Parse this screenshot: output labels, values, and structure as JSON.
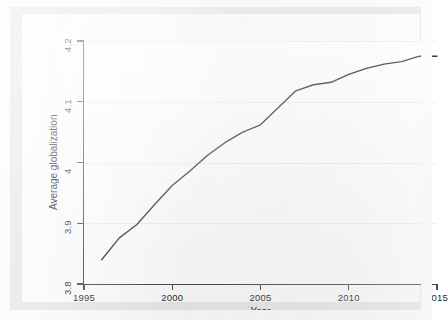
{
  "chart_data": {
    "type": "line",
    "title": "",
    "xlabel": "Year",
    "ylabel": "Average globalization",
    "xlim": [
      1995,
      2015
    ],
    "ylim": [
      3.8,
      4.2
    ],
    "xticks": [
      "1995",
      "2000",
      "2005",
      "2010",
      "2015"
    ],
    "xtick_values": [
      1995,
      2000,
      2005,
      2010,
      2015
    ],
    "yticks": [
      "3.8",
      "3.9",
      "4",
      "4.1",
      "4.2"
    ],
    "ytick_values": [
      3.8,
      3.9,
      4.0,
      4.1,
      4.2
    ],
    "grid": "horizontal",
    "legend": "none",
    "line_color": "#3c3c3c",
    "background_color": "#e9e9e7",
    "plot_background_color": "#ffffff",
    "axis_color": "#4a4a4a",
    "gridline_color": "#f0f0f0",
    "x": [
      1996,
      1997,
      1998,
      1999,
      2000,
      2001,
      2002,
      2003,
      2004,
      2005,
      2006,
      2007,
      2008,
      2009,
      2010,
      2011,
      2012,
      2013,
      2014,
      2015
    ],
    "series": [
      {
        "name": "Average globalization",
        "values": [
          3.84,
          3.876,
          3.898,
          3.931,
          3.962,
          3.986,
          4.012,
          4.033,
          4.05,
          4.062,
          4.09,
          4.118,
          4.128,
          4.132,
          4.145,
          4.155,
          4.162,
          4.166,
          4.175,
          4.175
        ]
      }
    ]
  },
  "axes": {
    "y_title": "Average globalization",
    "x_title": "Year"
  }
}
